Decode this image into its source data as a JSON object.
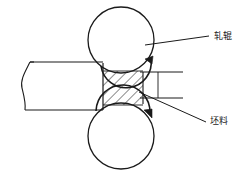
{
  "figure": {
    "type": "technical-line-diagram",
    "stroke_color": "#1a1a1a",
    "background_color": "#ffffff"
  },
  "labels": {
    "roll": "轧辊",
    "billet": "坯料"
  },
  "parts": {
    "top_roll": {
      "name": "top-roll",
      "cx": 121,
      "cy": 40,
      "r": 33
    },
    "bottom_roll": {
      "name": "bottom-roll",
      "cx": 121,
      "cy": 136,
      "r": 33
    },
    "billet_hatched": {
      "name": "billet-hatched-section",
      "x": 103,
      "y": 71,
      "width": 40,
      "height": 34
    },
    "workpiece": {
      "name": "workpiece-strip",
      "x_left": 22,
      "x_right": 103,
      "y_top": 62,
      "y_bottom": 110
    }
  },
  "annotations": {
    "top_rotation_arrow": "clockwise-rotation-arrow",
    "bottom_rotation_arrow": "clockwise-rotation-arrow",
    "roll_leader": "leader-line-to-top-roll",
    "billet_leader": "leader-line-to-billet",
    "extension_line_upper": "upper-extension-line",
    "extension_line_lower": "lower-extension-line"
  }
}
